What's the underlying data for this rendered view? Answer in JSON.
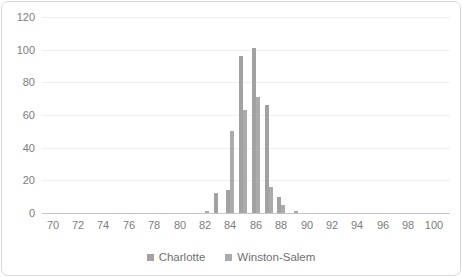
{
  "chart_data": {
    "type": "bar",
    "subtype": "clustered-column-histogram",
    "title": "",
    "xlabel": "",
    "ylabel": "",
    "categories": [
      82,
      83,
      84,
      85,
      86,
      87,
      88,
      89
    ],
    "series": [
      {
        "name": "Charlotte",
        "color": "#a2a2a2",
        "values": [
          0,
          12,
          14,
          96,
          101,
          66,
          10,
          0
        ]
      },
      {
        "name": "Winston-Salem",
        "color": "#ababab",
        "values": [
          1,
          0,
          50,
          63,
          71,
          16,
          5,
          1
        ]
      }
    ],
    "x_ticks": [
      70,
      72,
      74,
      76,
      78,
      80,
      82,
      84,
      86,
      88,
      90,
      92,
      94,
      96,
      98,
      100
    ],
    "y_ticks": [
      0,
      20,
      40,
      60,
      80,
      100,
      120
    ],
    "xlim": [
      69,
      101
    ],
    "ylim": [
      0,
      120
    ],
    "grid": "horizontal-light",
    "legend_position": "bottom",
    "axis_text_color": "#7c7c7c",
    "axis_line_color": "#c6c6c6",
    "background_color": "#ffffff",
    "border_color": "#d9d9d9"
  }
}
